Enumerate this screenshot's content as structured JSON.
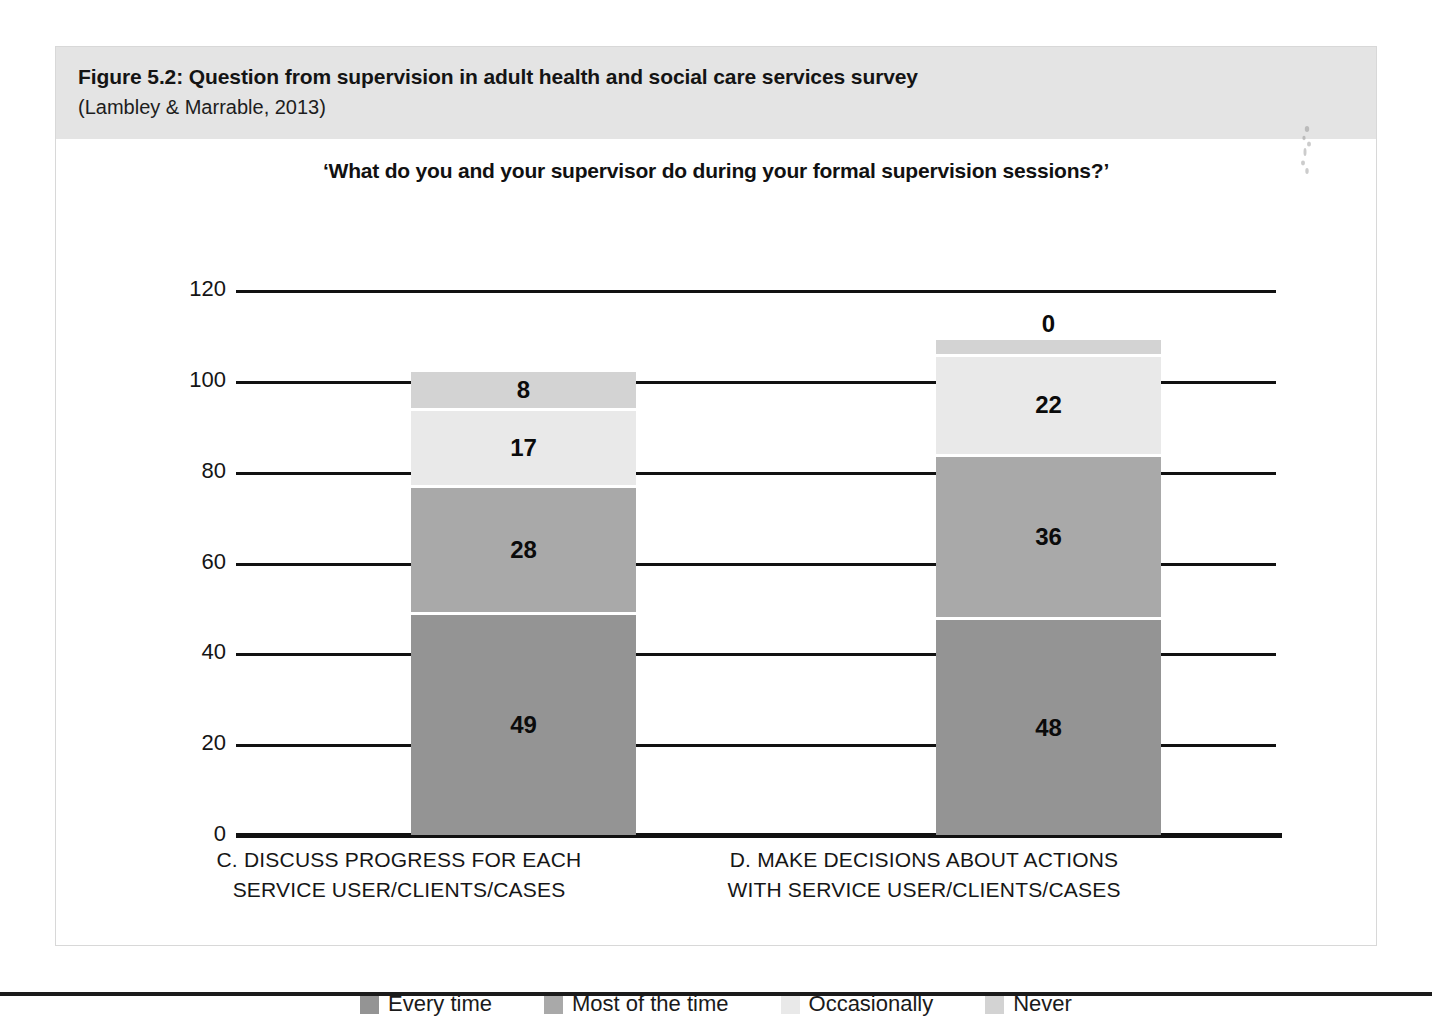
{
  "figure": {
    "title": "Figure 5.2: Question from supervision in adult health and social care services survey",
    "source": "(Lambley & Marrable, 2013)"
  },
  "chart_data": {
    "type": "bar",
    "subtype": "stacked-vertical",
    "title": "‘What do you and your supervisor do during your formal supervision sessions?’",
    "xlabel": "",
    "ylabel": "",
    "ylim": [
      0,
      120
    ],
    "yticks": [
      0,
      20,
      40,
      60,
      80,
      100,
      120
    ],
    "ytick_labels": [
      "0",
      "20",
      "40",
      "60",
      "80",
      "100",
      "120"
    ],
    "grid": true,
    "legend_position": "bottom",
    "categories": [
      "C. DISCUSS PROGRESS FOR EACH SERVICE USER/CLIENTS/CASES",
      "D. MAKE DECISIONS ABOUT ACTIONS WITH SERVICE USER/CLIENTS/CASES"
    ],
    "category_lines": [
      [
        "C. DISCUSS PROGRESS FOR EACH",
        "SERVICE USER/CLIENTS/CASES"
      ],
      [
        "D. MAKE DECISIONS ABOUT ACTIONS",
        "WITH SERVICE USER/CLIENTS/CASES"
      ]
    ],
    "series": [
      {
        "name": "Every time",
        "color": "#949494",
        "values": [
          49,
          48
        ]
      },
      {
        "name": "Most of the time",
        "color": "#a9a9a9",
        "values": [
          28,
          36
        ]
      },
      {
        "name": "Occasionally",
        "color": "#e9e9e9",
        "values": [
          17,
          22
        ]
      },
      {
        "name": "Never",
        "color": "#d3d3d3",
        "values": [
          8,
          0
        ]
      }
    ],
    "totals": [
      102,
      106
    ]
  },
  "legend": [
    {
      "label": "Every time",
      "color": "#949494"
    },
    {
      "label": "Most of the time",
      "color": "#a9a9a9"
    },
    {
      "label": "Occasionally",
      "color": "#e9e9e9"
    },
    {
      "label": "Never",
      "color": "#d3d3d3"
    }
  ]
}
